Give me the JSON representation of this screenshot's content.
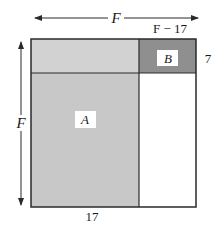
{
  "diagram": {
    "top_dimension_label": "F",
    "top_right_segment_label": "F − 17",
    "right_strip_height_label": "7",
    "left_dimension_label": "F",
    "bottom_segment_label": "17",
    "regions": [
      {
        "id": "A",
        "label": "A",
        "fill": "#c8c8c8"
      },
      {
        "id": "B",
        "label": "B",
        "fill": "#8f8f8f"
      },
      {
        "id": "top-left-strip",
        "label": "",
        "fill": "#d2d2d2"
      },
      {
        "id": "bottom-right",
        "label": "",
        "fill": "#ffffff"
      }
    ],
    "colors": {
      "outline": "#2a2a2a",
      "light_gray": "#d2d2d2",
      "medium_gray": "#c8c8c8",
      "dark_gray": "#8f8f8f",
      "label_box": "#ffffff"
    }
  }
}
